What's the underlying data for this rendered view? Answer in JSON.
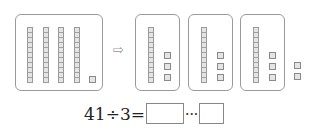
{
  "illustration": {
    "left_group": {
      "rods": 4,
      "units": 1,
      "total": 41
    },
    "arrow_icon": "⇨",
    "groups": [
      {
        "rods": 1,
        "units": 3
      },
      {
        "rods": 1,
        "units": 3
      },
      {
        "rods": 1,
        "units": 3
      }
    ],
    "remainder_units": 2
  },
  "equation": {
    "expression": "41÷3=",
    "ellipsis": "···",
    "quotient_value": "",
    "remainder_value": ""
  }
}
